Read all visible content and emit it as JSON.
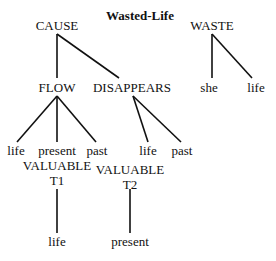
{
  "diagram": {
    "title": "Wasted-Life",
    "nodes": {
      "cause": "CAUSE",
      "waste": "WASTE",
      "flow": "FLOW",
      "disappears": "DISAPPEARS",
      "she": "she",
      "waste_life": "life",
      "flow_life": "life",
      "flow_present": "present",
      "flow_past": "past",
      "dis_life": "life",
      "dis_past": "past",
      "valuable1": "VALUABLE",
      "t1": "T1",
      "valuable2": "VALUABLE",
      "t2": "T2",
      "t1_life": "life",
      "t2_present": "present"
    },
    "edges": [
      [
        "CAUSE",
        "FLOW"
      ],
      [
        "CAUSE",
        "DISAPPEARS"
      ],
      [
        "WASTE",
        "she"
      ],
      [
        "WASTE",
        "life"
      ],
      [
        "FLOW",
        "life"
      ],
      [
        "FLOW",
        "present"
      ],
      [
        "FLOW",
        "past"
      ],
      [
        "DISAPPEARS",
        "life"
      ],
      [
        "DISAPPEARS",
        "past"
      ],
      [
        "VALUABLE T1",
        "life"
      ],
      [
        "VALUABLE T2",
        "present"
      ]
    ]
  }
}
